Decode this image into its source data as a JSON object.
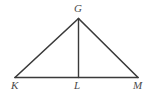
{
  "figure": {
    "kind": "geometry-diagram",
    "background_color": "#ffffff",
    "stroke_color": "#3a3a3a",
    "label_color": "#4a4a4a",
    "points": {
      "G": {
        "label": "G",
        "x": 78.5,
        "y": 18.5
      },
      "K": {
        "label": "K",
        "x": 15.0,
        "y": 77.5
      },
      "L": {
        "label": "L",
        "x": 78.5,
        "y": 77.5
      },
      "M": {
        "label": "M",
        "x": 138.0,
        "y": 77.5
      }
    },
    "segments": [
      {
        "name": "KG",
        "from": "K",
        "to": "G"
      },
      {
        "name": "GM",
        "from": "G",
        "to": "M"
      },
      {
        "name": "KM",
        "from": "K",
        "to": "M"
      },
      {
        "name": "GL",
        "from": "G",
        "to": "L"
      }
    ],
    "labels": {
      "G": "G",
      "K": "K",
      "L": "L",
      "M": "M"
    }
  }
}
